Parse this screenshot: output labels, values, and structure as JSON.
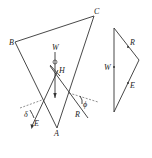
{
  "diagram": {
    "title": "",
    "space_diagram": {
      "labels": {
        "A": "A",
        "B": "B",
        "C": "C",
        "H": "H",
        "W": "W",
        "E": "E",
        "R": "R",
        "delta_left": "δ",
        "phi_right": "ϕ"
      }
    },
    "force_triangle": {
      "labels": {
        "W": "W",
        "R": "R",
        "E": "E"
      }
    }
  }
}
